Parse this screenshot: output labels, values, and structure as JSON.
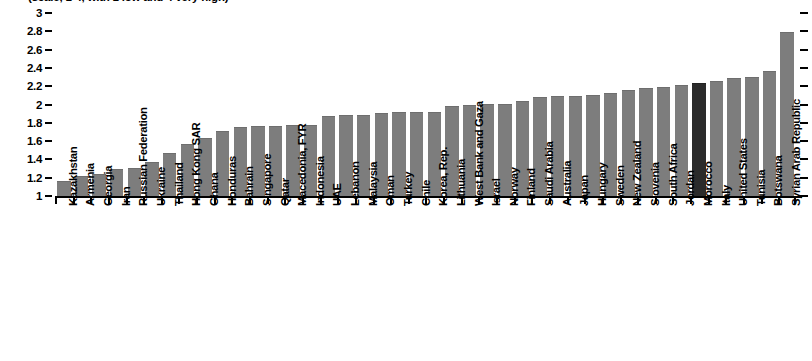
{
  "chart": {
    "title": "(scale, 1-4, with 1 low and 4 very high)",
    "highlight_label": "Morocco",
    "bar_color": "#7d7d7d",
    "highlight_color": "#2b2b2b"
  },
  "chart_data": {
    "type": "bar",
    "title": "(scale, 1-4, with 1 low and 4 very high)",
    "xlabel": "",
    "ylabel": "",
    "ylim": [
      1,
      3
    ],
    "yticks": [
      "1",
      "1.2",
      "1.4",
      "1.6",
      "1.8",
      "2",
      "2.2",
      "2.4",
      "2.6",
      "2.8",
      "3"
    ],
    "grid": false,
    "legend": "none",
    "highlight": {
      "category": "Morocco",
      "color": "#2b2b2b"
    },
    "categories": [
      "Kazakhstan",
      "Armenia",
      "Georgia",
      "Iran",
      "Russian Federation",
      "Ukraine",
      "Thailand",
      "Hong Kong SAR",
      "Ghana",
      "Honduras",
      "Bahrain",
      "Singapore",
      "Qatar",
      "Macedonia, FYR",
      "Indonesia",
      "UAE",
      "Lebanon",
      "Malaysia",
      "Oman",
      "Turkey",
      "Chile",
      "Korea, Rep.",
      "Lithuania",
      "West Bank and Gaza",
      "Israel",
      "Norway",
      "Finland",
      "Saudi Arabia",
      "Australia",
      "Japan",
      "Hungary",
      "Sweden",
      "New Zealand",
      "Slovenia",
      "South Africa",
      "Jordan",
      "Morocco",
      "Italy",
      "United States",
      "Tunisia",
      "Botswana",
      "Syrian Arab Republic"
    ],
    "values": [
      1.15,
      1.21,
      1.23,
      1.28,
      1.29,
      1.36,
      1.46,
      1.56,
      1.62,
      1.7,
      1.74,
      1.75,
      1.75,
      1.76,
      1.77,
      1.86,
      1.87,
      1.87,
      1.9,
      1.91,
      1.91,
      1.91,
      1.97,
      1.98,
      1.99,
      2.0,
      2.03,
      2.07,
      2.08,
      2.08,
      2.09,
      2.12,
      2.15,
      2.17,
      2.18,
      2.2,
      2.22,
      2.25,
      2.28,
      2.29,
      2.36,
      2.78
    ]
  }
}
